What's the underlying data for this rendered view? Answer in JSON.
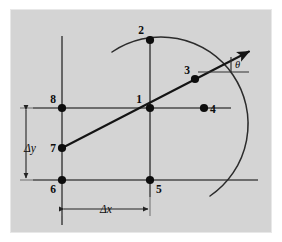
{
  "figure": {
    "background_color": "#d4d4d4",
    "page_color": "#ffffff",
    "line_color": "#4a4a4a",
    "accent_color": "#0d0d0d",
    "plate": {
      "x": 10,
      "y": 9,
      "width": 262,
      "height": 224
    }
  },
  "nodes": [
    {
      "id": "1",
      "label": "1",
      "x": 150,
      "y": 108,
      "label_x": 142,
      "label_y": 102,
      "anchor": "end"
    },
    {
      "id": "2",
      "label": "2",
      "x": 150,
      "y": 40,
      "label_x": 143,
      "label_y": 34,
      "anchor": "end"
    },
    {
      "id": "3",
      "label": "3",
      "x": 195,
      "y": 79,
      "label_x": 189,
      "label_y": 73,
      "anchor": "end"
    },
    {
      "id": "4",
      "label": "4",
      "x": 204,
      "y": 108,
      "label_x": 211,
      "label_y": 113,
      "anchor": "start"
    },
    {
      "id": "5",
      "label": "5",
      "x": 150,
      "y": 180,
      "label_x": 157,
      "label_y": 192,
      "anchor": "start"
    },
    {
      "id": "6",
      "label": "6",
      "x": 62,
      "y": 180,
      "label_x": 55,
      "label_y": 192,
      "anchor": "end"
    },
    {
      "id": "7",
      "label": "7",
      "x": 62,
      "y": 148,
      "label_x": 55,
      "label_y": 152,
      "anchor": "end"
    },
    {
      "id": "8",
      "label": "8",
      "x": 62,
      "y": 108,
      "label_x": 55,
      "label_y": 102,
      "anchor": "end"
    }
  ],
  "grid_lines": [
    {
      "name": "vertical-line-left",
      "x1": 62,
      "y1": 36,
      "x2": 62,
      "y2": 225
    },
    {
      "name": "vertical-line-center",
      "x1": 150,
      "y1": 36,
      "x2": 150,
      "y2": 197
    },
    {
      "name": "horizontal-line-mid",
      "x1": 33,
      "y1": 108,
      "x2": 231,
      "y2": 108
    },
    {
      "name": "horizontal-line-bottom",
      "x1": 33,
      "y1": 180,
      "x2": 258,
      "y2": 180
    }
  ],
  "arc": {
    "name": "circular-arc",
    "center_x": 150,
    "center_y": 108,
    "radius": 68,
    "start_x": 112,
    "start_y": 52,
    "end_x": 210,
    "end_y": 196
  },
  "ray": {
    "name": "direction-ray",
    "start_x": 62,
    "start_y": 148,
    "end_x": 252,
    "end_y": 50,
    "arrowhead": true
  },
  "angle": {
    "label": "θ",
    "label_x": 235,
    "label_y": 66,
    "reference_line": {
      "x1": 198,
      "y1": 72,
      "x2": 249,
      "y2": 72
    },
    "tick_line": {
      "x1": 231,
      "y1": 57,
      "x2": 231,
      "y2": 72
    }
  },
  "dimensions": [
    {
      "name": "delta-y",
      "label": "Δy",
      "orientation": "vertical",
      "label_x": 30,
      "label_y": 148,
      "line": {
        "x1": 26,
        "y1": 108,
        "x2": 26,
        "y2": 180
      },
      "ext_lines": [
        {
          "x1": 20,
          "y1": 108,
          "x2": 62,
          "y2": 108
        },
        {
          "x1": 20,
          "y1": 180,
          "x2": 62,
          "y2": 180
        }
      ]
    },
    {
      "name": "delta-x",
      "label": "Δx",
      "orientation": "horizontal",
      "label_x": 106,
      "label_y": 213,
      "line": {
        "x1": 62,
        "y1": 209,
        "x2": 150,
        "y2": 209
      },
      "ext_lines": [
        {
          "x1": 62,
          "y1": 185,
          "x2": 62,
          "y2": 215
        },
        {
          "x1": 150,
          "y1": 185,
          "x2": 150,
          "y2": 215
        }
      ]
    }
  ]
}
